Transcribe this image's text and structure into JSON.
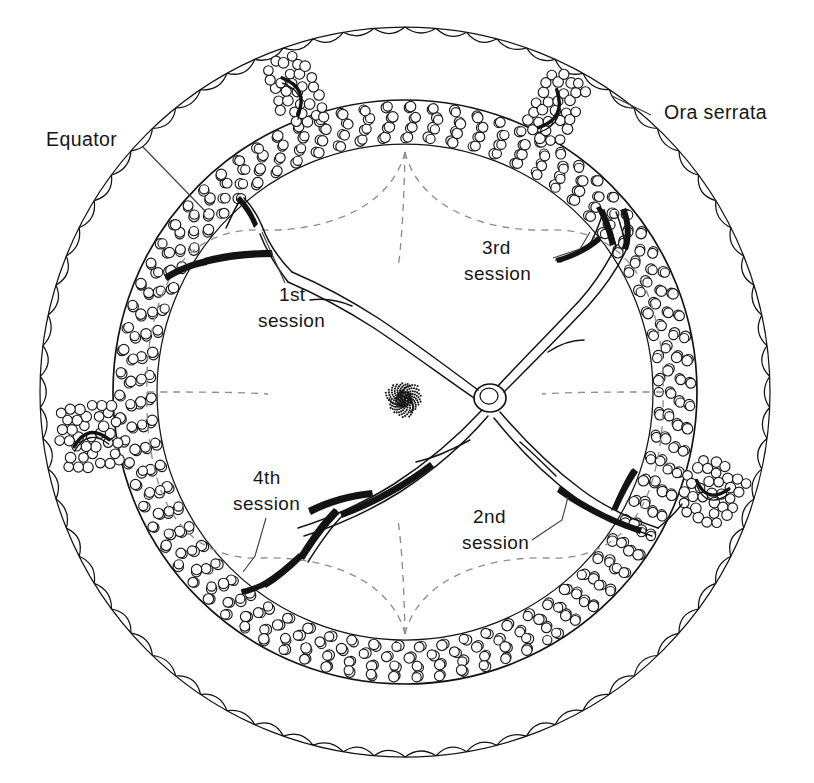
{
  "figure": {
    "type": "anatomical-line-diagram",
    "background_color": "#ffffff",
    "ink_color": "#131313",
    "dashed_guide_color": "#8d8d8d",
    "leader_line_color": "#3b3b3b"
  },
  "labels": {
    "ora_serrata": "Ora serrata",
    "equator": "Equator",
    "session_1_line1": "1st",
    "session_1_line2": "session",
    "session_2_line1": "2nd",
    "session_2_line2": "session",
    "session_3_line1": "3rd",
    "session_3_line2": "session",
    "session_4_line1": "4th",
    "session_4_line2": "session"
  },
  "structures": {
    "outer_ring": "ora-serrata-scalloped-boundary",
    "equator_ring": "equator-circle",
    "treatment_band": "circumferential-treatment-spot-band",
    "optic_disc": "optic-disc",
    "macula": "macula-stipple",
    "vessels": "retinal-vascular-arcades",
    "quadrant_guides": "dashed-session-quadrant-boundaries"
  },
  "geometry": {
    "outer_circle": {
      "cx": 405,
      "cy": 392,
      "r": 365
    },
    "equator_circle": {
      "cx": 405,
      "cy": 392,
      "r": 292
    },
    "band_outer_r": 288,
    "band_inner_r": 250,
    "optic_disc": {
      "cx": 490,
      "cy": 398,
      "rx": 16,
      "ry": 14
    },
    "macula": {
      "cx": 404,
      "cy": 399,
      "r": 19
    }
  },
  "sessions": [
    {
      "id": 1,
      "name": "1st session",
      "quadrant": "superior-nasal",
      "label_x": 300,
      "label_y": 305
    },
    {
      "id": 2,
      "name": "2nd session",
      "quadrant": "inferior-temporal",
      "label_x": 500,
      "label_y": 525
    },
    {
      "id": 3,
      "name": "3rd session",
      "quadrant": "superior-temporal",
      "label_x": 512,
      "label_y": 260
    },
    {
      "id": 4,
      "name": "4th session",
      "quadrant": "inferior-nasal",
      "label_x": 275,
      "label_y": 490
    }
  ]
}
